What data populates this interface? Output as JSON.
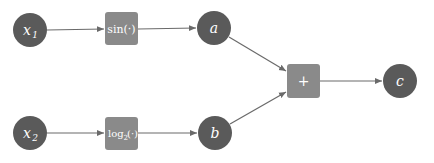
{
  "diagram": {
    "type": "computational-graph",
    "colors": {
      "variable_node": "#5a5a5a",
      "operation_node": "#8a8a8a",
      "edge": "#6a6a6a",
      "label": "#ffffff",
      "background": "#ffffff"
    },
    "nodes": [
      {
        "id": "x1",
        "kind": "variable",
        "label": "x",
        "sub": "1",
        "cx": 30,
        "cy": 30
      },
      {
        "id": "sin",
        "kind": "operation",
        "label": "sin(·)",
        "cx": 121,
        "cy": 29
      },
      {
        "id": "a",
        "kind": "variable",
        "label": "a",
        "cx": 214,
        "cy": 28
      },
      {
        "id": "x2",
        "kind": "variable",
        "label": "x",
        "sub": "2",
        "cx": 30,
        "cy": 133
      },
      {
        "id": "log",
        "kind": "operation",
        "label": "log",
        "sub": "2",
        "suffix": "(·)",
        "cx": 121,
        "cy": 133
      },
      {
        "id": "b",
        "kind": "variable",
        "label": "b",
        "cx": 215,
        "cy": 133
      },
      {
        "id": "plus",
        "kind": "operation",
        "label": "+",
        "cx": 303,
        "cy": 81
      },
      {
        "id": "c",
        "kind": "variable",
        "label": "c",
        "cx": 400,
        "cy": 81
      }
    ],
    "edges": [
      {
        "from": "x1",
        "to": "sin"
      },
      {
        "from": "sin",
        "to": "a"
      },
      {
        "from": "x2",
        "to": "log"
      },
      {
        "from": "log",
        "to": "b"
      },
      {
        "from": "a",
        "to": "plus"
      },
      {
        "from": "b",
        "to": "plus"
      },
      {
        "from": "plus",
        "to": "c"
      }
    ]
  },
  "labels": {
    "x1": "x",
    "x1_sub": "1",
    "sin": "sin(·)",
    "a": "a",
    "x2": "x",
    "x2_sub": "2",
    "log": "log",
    "log_sub": "2",
    "log_suffix": "(·)",
    "b": "b",
    "plus": "+",
    "c": "c"
  }
}
